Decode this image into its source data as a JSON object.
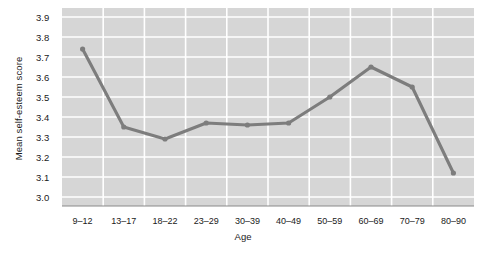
{
  "chart_data": {
    "type": "line",
    "title": "",
    "xlabel": "Age",
    "ylabel": "Mean self-esteem score",
    "categories": [
      "9–12",
      "13–17",
      "18–22",
      "23–29",
      "30–39",
      "40–49",
      "50–59",
      "60–69",
      "70–79",
      "80–90"
    ],
    "values": [
      3.74,
      3.35,
      3.29,
      3.37,
      3.36,
      3.37,
      3.5,
      3.65,
      3.55,
      3.12
    ],
    "series": [
      {
        "name": "Mean self-esteem score",
        "values": [
          3.74,
          3.35,
          3.29,
          3.37,
          3.36,
          3.37,
          3.5,
          3.65,
          3.55,
          3.12
        ]
      }
    ],
    "ylim": [
      3.0,
      3.9
    ],
    "ytick_labels": [
      "3.0",
      "3.1",
      "3.2",
      "3.3",
      "3.4",
      "3.5",
      "3.6",
      "3.7",
      "3.8",
      "3.9"
    ],
    "ytick_values": [
      3.0,
      3.1,
      3.2,
      3.3,
      3.4,
      3.5,
      3.6,
      3.7,
      3.8,
      3.9
    ],
    "grid": true,
    "legend": "none",
    "colors": {
      "line": "#7d7d7d",
      "marker": "#7d7d7d",
      "plot_background": "#d6d6d6",
      "gridline": "#ffffff",
      "axis": "#8a8a8a",
      "text": "#1a1a1a",
      "page_background": "#ffffff"
    }
  }
}
